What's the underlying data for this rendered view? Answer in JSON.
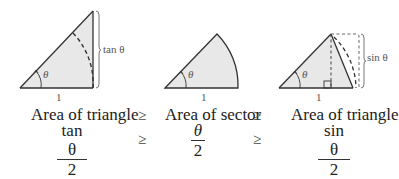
{
  "figures": {
    "left": {
      "angle_label": "θ",
      "base_label": "1",
      "side_label": "tan θ"
    },
    "middle": {
      "angle_label": "θ",
      "base_label": "1"
    },
    "right": {
      "angle_label": "θ",
      "base_label": "1",
      "side_label": "sin θ"
    }
  },
  "captions": {
    "left": "Area of triangle",
    "middle": "Area of sector",
    "right": "Area of triangle",
    "relation": "≥"
  },
  "formulas": {
    "left": {
      "numerator": "tan θ",
      "denominator": "2"
    },
    "middle": {
      "numerator": "θ",
      "denominator": "2"
    },
    "right": {
      "numerator": "sin θ",
      "denominator": "2"
    },
    "relation": "≥"
  },
  "colors": {
    "fill": "#e8e8e8",
    "stroke": "#333333",
    "dashed": "#444444",
    "label": "#555555"
  }
}
